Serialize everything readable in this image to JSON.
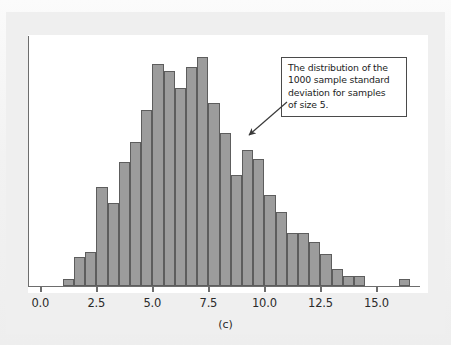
{
  "figure": {
    "caption": "(c)",
    "panel_background": "#ffffff",
    "page_background": "#efefef"
  },
  "annotation": {
    "text": "The distribution of the 1000 sample standard deviation for samples of size 5.",
    "lines": [
      "The distribution of the",
      "1000 sample standard",
      "deviation for samples",
      "of size 5."
    ],
    "border_color": "#4a4a4a",
    "arrow_from": [
      288,
      103
    ],
    "arrow_to": [
      247,
      137
    ]
  },
  "chart_data": {
    "type": "bar",
    "title": "",
    "subtitle": "",
    "xlabel": "",
    "ylabel": "",
    "caption": "(c)",
    "grid": false,
    "legend": "none",
    "bar_fill": "#9c9c9c",
    "bar_edge": "#5d5d5d",
    "axis_color": "#6d6d6d",
    "bin_width": 0.5,
    "xlim": [
      -0.55,
      17.3
    ],
    "ylim": [
      0,
      1.0
    ],
    "tick_labels": [
      "0.0",
      "2.5",
      "5.0",
      "7.5",
      "10.0",
      "12.5",
      "15.0"
    ],
    "tick_values": [
      0.0,
      2.5,
      5.0,
      7.5,
      10.0,
      12.5,
      15.0
    ],
    "bin_starts": [
      1.0,
      1.5,
      2.0,
      2.5,
      3.0,
      3.5,
      4.0,
      4.5,
      5.0,
      5.5,
      6.0,
      6.5,
      7.0,
      7.5,
      8.0,
      8.5,
      9.0,
      9.5,
      10.0,
      10.5,
      11.0,
      11.5,
      12.0,
      12.5,
      13.0,
      13.5,
      14.0,
      16.0
    ],
    "values": [
      0.03,
      0.12,
      0.14,
      0.4,
      0.335,
      0.5,
      0.58,
      0.71,
      0.895,
      0.87,
      0.8,
      0.885,
      0.925,
      0.74,
      0.62,
      0.45,
      0.55,
      0.515,
      0.37,
      0.3,
      0.215,
      0.215,
      0.18,
      0.13,
      0.07,
      0.04,
      0.04,
      0.028
    ]
  }
}
